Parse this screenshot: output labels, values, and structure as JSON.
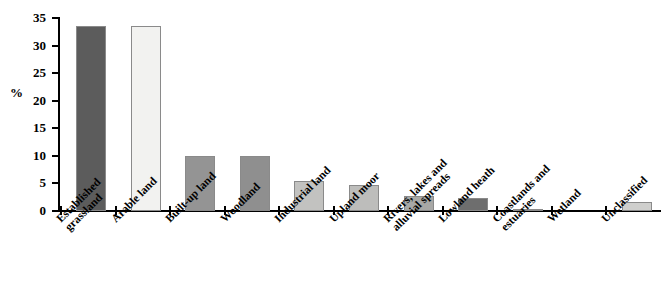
{
  "chart_data": {
    "type": "bar",
    "title": "",
    "subtitle": "",
    "xlabel": "",
    "ylabel": "%",
    "ylim": [
      0,
      35
    ],
    "ytick_values": [
      0,
      5,
      10,
      15,
      20,
      25,
      30,
      35
    ],
    "ytick_labels": [
      "0",
      "5",
      "10",
      "15",
      "20",
      "25",
      "30",
      "35"
    ],
    "grid": false,
    "legend": "none",
    "categories": [
      "Established grassland",
      "Arable land",
      "Built-up land",
      "Woodland",
      "Industrial land",
      "Upland moor",
      "Rivers, lakes and alluvial spreads",
      "Lowland heath",
      "Coastlands and estuaries",
      "Wetland",
      "Unclassified"
    ],
    "category_lines": [
      [
        "Established",
        "grassland"
      ],
      [
        "Arable land"
      ],
      [
        "Built-up land"
      ],
      [
        "Woodland"
      ],
      [
        "Industrial land"
      ],
      [
        "Upland moor"
      ],
      [
        "Rivers, lakes and",
        "alluvial spreads"
      ],
      [
        "Lowland heath"
      ],
      [
        "Coastlands and",
        "estuaries"
      ],
      [
        "Wetland"
      ],
      [
        "Unclassified"
      ]
    ],
    "values": [
      33.5,
      33.5,
      10.0,
      9.9,
      5.5,
      4.8,
      2.7,
      2.3,
      0.3,
      0.05,
      1.7
    ],
    "bar_colors": [
      "#5c5c5c",
      "#f2f2f0",
      "#949494",
      "#8f8f8f",
      "#c2c2c0",
      "#bdbdbb",
      "#a8a8a6",
      "#6e6e6e",
      "#b5b5b3",
      "#d0d0ce",
      "#cfcfcd"
    ],
    "bar_border_color": "#8a8a8a",
    "axis_color": "#000000",
    "background_color": "#ffffff"
  }
}
